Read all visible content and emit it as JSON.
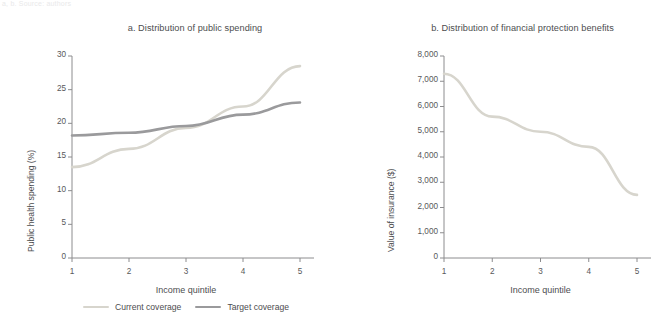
{
  "figure": {
    "caption_fragment": "a, b. Source: authors",
    "background": "#ffffff",
    "text_color": "#58585a"
  },
  "colors": {
    "current_coverage": "#d7d5cd",
    "target_coverage": "#9a9a9c",
    "axis": "#8c8c8e",
    "label": "#4d4d4f"
  },
  "legend": {
    "items": [
      {
        "label": "Current coverage",
        "color": "#d7d5cd"
      },
      {
        "label": "Target coverage",
        "color": "#9a9a9c"
      }
    ]
  },
  "chart_data": [
    {
      "type": "line",
      "title": "a. Distribution of public spending",
      "xlabel": "Income quintile",
      "ylabel": "Public health spending (%)",
      "categories": [
        "1",
        "2",
        "3",
        "4",
        "5"
      ],
      "x": [
        1,
        2,
        3,
        4,
        5
      ],
      "xlim": [
        1,
        5
      ],
      "ylim": [
        0,
        30
      ],
      "yticks": [
        0,
        5,
        10,
        15,
        20,
        25,
        30
      ],
      "ytick_labels": [
        "0",
        "5",
        "10",
        "15",
        "20",
        "25",
        "30"
      ],
      "xtick_labels": [
        "1",
        "2",
        "3",
        "4",
        "5"
      ],
      "grid": false,
      "legend_position": "bottom",
      "series": [
        {
          "name": "Current coverage",
          "color": "#d7d5cd",
          "values": [
            13.5,
            16.2,
            19.3,
            22.5,
            28.5
          ]
        },
        {
          "name": "Target coverage",
          "color": "#9a9a9c",
          "values": [
            18.2,
            18.6,
            19.6,
            21.3,
            23.1
          ]
        }
      ]
    },
    {
      "type": "line",
      "title": "b. Distribution of financial protection benefits",
      "xlabel": "Income quintile",
      "ylabel": "Value of insurance ($)",
      "categories": [
        "1",
        "2",
        "3",
        "4",
        "5"
      ],
      "x": [
        1,
        2,
        3,
        4,
        5
      ],
      "xlim": [
        1,
        5
      ],
      "ylim": [
        0,
        8000
      ],
      "yticks": [
        0,
        1000,
        2000,
        3000,
        4000,
        5000,
        6000,
        7000,
        8000
      ],
      "ytick_labels": [
        "0",
        "1,000",
        "2,000",
        "3,000",
        "4,000",
        "5,000",
        "6,000",
        "7,000",
        "8,000"
      ],
      "xtick_labels": [
        "1",
        "2",
        "3",
        "4",
        "5"
      ],
      "grid": false,
      "legend_position": "none",
      "series": [
        {
          "name": "Current coverage",
          "color": "#d7d5cd",
          "values": [
            7300,
            5600,
            5000,
            4400,
            2500
          ]
        }
      ]
    }
  ]
}
